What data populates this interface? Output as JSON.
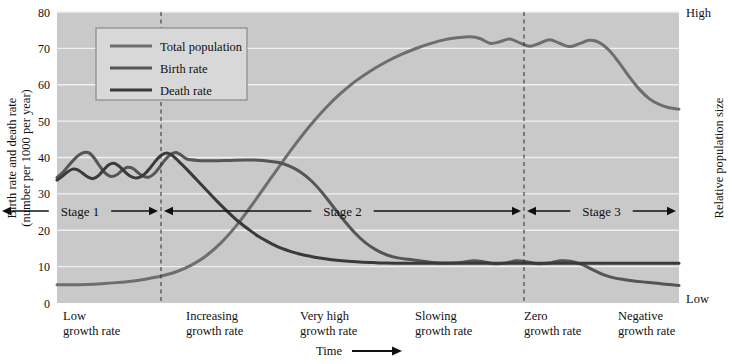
{
  "chart_data": {
    "type": "line",
    "title": "",
    "subtitle": "",
    "xlabel": "Time",
    "ylabel": "Birth rate and death rate (number per 1000 per year)",
    "ylabel_line1": "Birth rate and death rate",
    "ylabel_line2": "(number per 1000 per year)",
    "y2label": "Relative population size",
    "y2_high": "High",
    "y2_low": "Low",
    "ylim": [
      0,
      80
    ],
    "yticks": [
      0,
      10,
      20,
      30,
      40,
      50,
      60,
      70,
      80
    ],
    "ytick_labels": [
      "0",
      "10",
      "20",
      "30",
      "40",
      "50",
      "60",
      "70",
      "80"
    ],
    "xlim": [
      0,
      100
    ],
    "grid": true,
    "grid_color": "#f0f0f0",
    "plot_background": "#c9c9c9",
    "legend_position": "top-left",
    "legend_background": "#d8d8d8",
    "series": [
      {
        "name": "Total population",
        "color": "#6e6e6e",
        "width": 3.0,
        "points": [
          [
            0,
            5.0
          ],
          [
            3,
            5.0
          ],
          [
            6,
            5.1
          ],
          [
            9,
            5.3
          ],
          [
            12,
            5.6
          ],
          [
            15,
            6.0
          ],
          [
            18,
            6.6
          ],
          [
            21,
            7.4
          ],
          [
            24,
            8.6
          ],
          [
            27,
            10.4
          ],
          [
            30,
            13.0
          ],
          [
            33,
            16.6
          ],
          [
            36,
            21.2
          ],
          [
            39,
            26.6
          ],
          [
            42,
            32.4
          ],
          [
            45,
            38.2
          ],
          [
            48,
            43.8
          ],
          [
            51,
            49.0
          ],
          [
            54,
            53.6
          ],
          [
            57,
            57.6
          ],
          [
            60,
            61.0
          ],
          [
            63,
            63.8
          ],
          [
            66,
            66.2
          ],
          [
            69,
            68.2
          ],
          [
            72,
            69.9
          ],
          [
            75,
            71.3
          ],
          [
            78,
            72.4
          ],
          [
            81,
            73.0
          ],
          [
            83,
            73.2
          ],
          [
            85,
            72.7
          ],
          [
            87,
            71.4
          ],
          [
            89,
            71.8
          ],
          [
            91,
            72.6
          ],
          [
            93,
            71.5
          ],
          [
            95,
            70.6
          ],
          [
            97,
            71.4
          ],
          [
            99,
            72.4
          ],
          [
            101,
            71.4
          ],
          [
            103,
            70.5
          ],
          [
            105,
            71.3
          ],
          [
            107,
            72.2
          ],
          [
            109,
            71.6
          ],
          [
            111,
            69.4
          ],
          [
            113,
            66.0
          ],
          [
            115,
            62.2
          ],
          [
            117,
            58.8
          ],
          [
            119,
            56.2
          ],
          [
            121,
            54.6
          ],
          [
            123,
            53.7
          ],
          [
            125,
            53.3
          ]
        ]
      },
      {
        "name": "Birth rate",
        "color": "#555555",
        "width": 3.0,
        "points": [
          [
            0,
            34.5
          ],
          [
            2,
            35.8
          ],
          [
            4,
            37.5
          ],
          [
            6,
            39.2
          ],
          [
            8,
            40.6
          ],
          [
            10,
            41.4
          ],
          [
            12,
            41.2
          ],
          [
            14,
            39.6
          ],
          [
            16,
            37.4
          ],
          [
            18,
            35.6
          ],
          [
            20,
            34.8
          ],
          [
            22,
            35.2
          ],
          [
            24,
            36.4
          ],
          [
            26,
            37.3
          ],
          [
            28,
            37.0
          ],
          [
            30,
            35.8
          ],
          [
            32,
            34.8
          ],
          [
            34,
            34.6
          ],
          [
            36,
            35.6
          ],
          [
            38,
            37.4
          ],
          [
            40,
            39.4
          ],
          [
            42,
            40.8
          ],
          [
            44,
            41.4
          ],
          [
            46,
            40.6
          ],
          [
            48,
            39.6
          ],
          [
            52,
            39.2
          ],
          [
            58,
            39.1
          ],
          [
            64,
            39.2
          ],
          [
            70,
            39.3
          ],
          [
            76,
            39.2
          ],
          [
            82,
            38.6
          ],
          [
            86,
            37.6
          ],
          [
            90,
            36.0
          ],
          [
            94,
            33.6
          ],
          [
            98,
            30.4
          ],
          [
            102,
            26.6
          ],
          [
            106,
            22.8
          ],
          [
            110,
            19.4
          ],
          [
            114,
            16.6
          ],
          [
            118,
            14.6
          ],
          [
            122,
            13.2
          ],
          [
            126,
            12.4
          ],
          [
            130,
            12.0
          ],
          [
            134,
            11.6
          ],
          [
            138,
            11.2
          ],
          [
            142,
            11.0
          ],
          [
            146,
            11.0
          ],
          [
            150,
            11.2
          ],
          [
            154,
            11.6
          ],
          [
            158,
            11.3
          ],
          [
            162,
            10.8
          ],
          [
            166,
            11.0
          ],
          [
            170,
            11.6
          ],
          [
            174,
            11.3
          ],
          [
            178,
            10.8
          ],
          [
            182,
            11.0
          ],
          [
            186,
            11.6
          ],
          [
            190,
            11.5
          ],
          [
            194,
            10.6
          ],
          [
            198,
            9.2
          ],
          [
            202,
            7.8
          ],
          [
            206,
            6.9
          ],
          [
            210,
            6.4
          ],
          [
            214,
            6.0
          ],
          [
            218,
            5.7
          ],
          [
            222,
            5.4
          ],
          [
            226,
            5.1
          ],
          [
            230,
            4.8
          ]
        ]
      },
      {
        "name": "Death rate",
        "color": "#3a3a3a",
        "width": 3.0,
        "points": [
          [
            0,
            33.8
          ],
          [
            2,
            34.8
          ],
          [
            4,
            36.0
          ],
          [
            6,
            36.8
          ],
          [
            8,
            36.6
          ],
          [
            10,
            35.6
          ],
          [
            12,
            34.6
          ],
          [
            14,
            34.2
          ],
          [
            16,
            35.0
          ],
          [
            18,
            36.6
          ],
          [
            20,
            38.0
          ],
          [
            22,
            38.4
          ],
          [
            24,
            37.6
          ],
          [
            26,
            36.2
          ],
          [
            28,
            35.0
          ],
          [
            30,
            34.4
          ],
          [
            32,
            34.6
          ],
          [
            34,
            35.6
          ],
          [
            36,
            37.2
          ],
          [
            38,
            39.0
          ],
          [
            40,
            40.5
          ],
          [
            42,
            41.2
          ],
          [
            44,
            40.8
          ],
          [
            46,
            39.6
          ],
          [
            48,
            38.2
          ],
          [
            50,
            36.8
          ],
          [
            54,
            33.8
          ],
          [
            58,
            30.8
          ],
          [
            62,
            27.8
          ],
          [
            66,
            25.0
          ],
          [
            70,
            22.4
          ],
          [
            74,
            20.2
          ],
          [
            78,
            18.2
          ],
          [
            82,
            16.6
          ],
          [
            86,
            15.2
          ],
          [
            90,
            14.2
          ],
          [
            94,
            13.4
          ],
          [
            98,
            12.8
          ],
          [
            102,
            12.3
          ],
          [
            106,
            11.9
          ],
          [
            110,
            11.6
          ],
          [
            114,
            11.4
          ],
          [
            118,
            11.2
          ],
          [
            122,
            11.1
          ],
          [
            126,
            11.0
          ],
          [
            134,
            10.9
          ],
          [
            146,
            10.9
          ],
          [
            160,
            10.9
          ],
          [
            180,
            10.9
          ],
          [
            200,
            10.9
          ],
          [
            220,
            10.9
          ],
          [
            240,
            10.9
          ]
        ]
      }
    ],
    "stages": [
      {
        "label": "Stage 1",
        "start": 0,
        "end": 161
      },
      {
        "label": "Stage 2",
        "start": 161,
        "end": 524
      },
      {
        "label": "Stage 3",
        "start": 524,
        "end": 679
      }
    ],
    "dividers": [
      161,
      524
    ],
    "categories": [
      {
        "line1": "Low",
        "line2": "growth rate"
      },
      {
        "line1": "Increasing",
        "line2": "growth rate"
      },
      {
        "line1": "Very high",
        "line2": "growth rate"
      },
      {
        "line1": "Slowing",
        "line2": "growth rate"
      },
      {
        "line1": "Zero",
        "line2": "growth rate"
      },
      {
        "line1": "Negative",
        "line2": "growth rate"
      }
    ],
    "legend_entries": [
      {
        "label": "Total population",
        "color": "#6e6e6e"
      },
      {
        "label": "Birth rate",
        "color": "#555555"
      },
      {
        "label": "Death rate",
        "color": "#3a3a3a"
      }
    ]
  }
}
